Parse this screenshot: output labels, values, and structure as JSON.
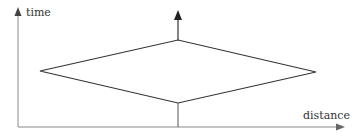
{
  "diagram": {
    "type": "spacetime-diagram",
    "axes": {
      "y_label": "time",
      "x_label": "distance"
    },
    "colors": {
      "axis": "#888888",
      "shape": "#333333",
      "arrow": "#222222",
      "background": "#ffffff"
    },
    "shape": {
      "kind": "diamond",
      "vertices": {
        "left": [
          40,
          71
        ],
        "top": [
          178,
          40
        ],
        "right": [
          316,
          72
        ],
        "bottom": [
          178,
          103
        ]
      }
    },
    "center_arrow": {
      "x": 178,
      "from_y": 126,
      "to_y": 12
    }
  }
}
